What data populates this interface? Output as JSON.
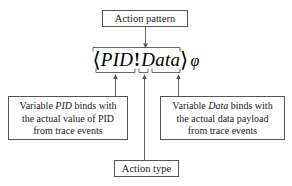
{
  "diagram": {
    "stroke_color": "#555555",
    "text_color": "#1a1a1a",
    "background": "#ffffff"
  },
  "formula": {
    "open_bracket": "⟨",
    "var_pid": "PID",
    "operator": "!",
    "var_data": "Data",
    "close_bracket": "⟩",
    "suffix": "φ"
  },
  "boxes": {
    "action_pattern": {
      "label": "Action pattern"
    },
    "action_type": {
      "label": "Action type"
    },
    "left": {
      "line1_prefix": "Variable ",
      "line1_italic": "PID",
      "line1_suffix": " binds with",
      "line2": "the actual value of PID",
      "line3": "from trace events"
    },
    "right": {
      "line1_prefix": "Variable ",
      "line1_italic": "Data",
      "line1_suffix": " binds with",
      "line2": "the actual data payload",
      "line3": "from trace events"
    }
  }
}
